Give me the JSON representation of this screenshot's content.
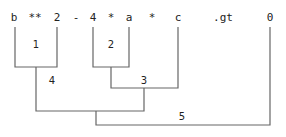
{
  "tokens": [
    {
      "text": "b",
      "x": 14
    },
    {
      "text": "**",
      "x": 35
    },
    {
      "text": "2",
      "x": 57
    },
    {
      "text": "-",
      "x": 76
    },
    {
      "text": "4",
      "x": 93
    },
    {
      "text": "*",
      "x": 111
    },
    {
      "text": "a",
      "x": 129
    },
    {
      "text": "*",
      "x": 152
    },
    {
      "text": "c",
      "x": 178
    },
    {
      "text": ".gt",
      "x": 223
    },
    {
      "text": "0",
      "x": 270
    }
  ],
  "brackets": [
    {
      "label": "1"
    },
    {
      "label": "2"
    },
    {
      "label": "3"
    },
    {
      "label": "4"
    },
    {
      "label": "5"
    }
  ],
  "colors": {
    "line": "#666666",
    "text": "#222222"
  }
}
